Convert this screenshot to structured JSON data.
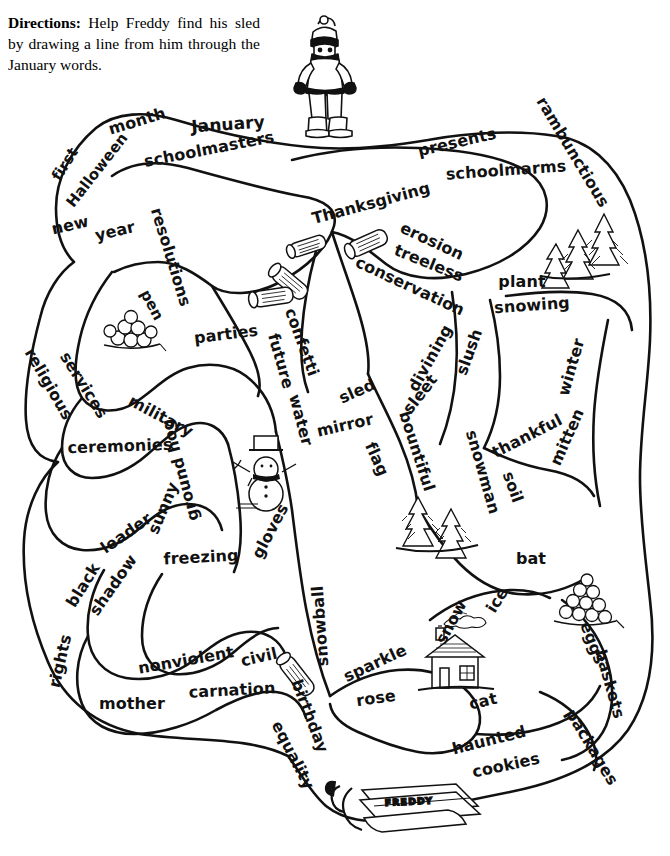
{
  "page": {
    "width": 670,
    "height": 856,
    "background_color": "#ffffff",
    "ink_color": "#111111"
  },
  "directions": {
    "lead_label": "Directions:",
    "body": "Help Freddy find his sled by drawing a line from him through the January words."
  },
  "characters": {
    "freddy": {
      "name_label": "Freddy",
      "description": "boy in winter coat, knit cap, scarf, mittens and boots"
    },
    "sled": {
      "name_label": "FREDDY",
      "description": "wooden sled with rope, labeled FREDDY"
    }
  },
  "illustrations": [
    {
      "name": "snowman",
      "label": "snowman with top hat and scarf"
    },
    {
      "name": "house",
      "label": "house with smoking chimney"
    },
    {
      "name": "pine-trees-top",
      "label": "pair of pine trees"
    },
    {
      "name": "pine-trees-middle",
      "label": "pair of pine trees"
    },
    {
      "name": "logs",
      "label": "scattered cut logs"
    },
    {
      "name": "snowball-pile-left",
      "label": "pile of snowballs"
    },
    {
      "name": "snowball-pile-right",
      "label": "pile of snowballs / eggs"
    }
  ],
  "words": [
    {
      "text": "month",
      "x": 137,
      "y": 121,
      "rot": -17,
      "size": 16
    },
    {
      "text": "January",
      "x": 228,
      "y": 124,
      "rot": -4,
      "size": 17
    },
    {
      "text": "schoolmasters",
      "x": 209,
      "y": 149,
      "rot": -11,
      "size": 16
    },
    {
      "text": "first",
      "x": 65,
      "y": 164,
      "rot": -58,
      "size": 15
    },
    {
      "text": "Halloween",
      "x": 97,
      "y": 170,
      "rot": -52,
      "size": 15
    },
    {
      "text": "new",
      "x": 70,
      "y": 225,
      "rot": -13,
      "size": 16
    },
    {
      "text": "year",
      "x": 115,
      "y": 231,
      "rot": -13,
      "size": 16
    },
    {
      "text": "resolutions",
      "x": 171,
      "y": 257,
      "rot": 73,
      "size": 16
    },
    {
      "text": "pen",
      "x": 152,
      "y": 305,
      "rot": 62,
      "size": 15
    },
    {
      "text": "parties",
      "x": 226,
      "y": 334,
      "rot": -7,
      "size": 16
    },
    {
      "text": "presents",
      "x": 457,
      "y": 142,
      "rot": -13,
      "size": 16
    },
    {
      "text": "rambunctious",
      "x": 573,
      "y": 152,
      "rot": 59,
      "size": 16
    },
    {
      "text": "schoolmarms",
      "x": 506,
      "y": 170,
      "rot": -4,
      "size": 16
    },
    {
      "text": "Thanksgiving",
      "x": 371,
      "y": 203,
      "rot": -15,
      "size": 16
    },
    {
      "text": "erosion",
      "x": 432,
      "y": 241,
      "rot": 25,
      "size": 16
    },
    {
      "text": "treeless",
      "x": 429,
      "y": 263,
      "rot": 22,
      "size": 16
    },
    {
      "text": "conservation",
      "x": 410,
      "y": 286,
      "rot": 25,
      "size": 16
    },
    {
      "text": "plant",
      "x": 522,
      "y": 281,
      "rot": 0,
      "size": 16
    },
    {
      "text": "snowing",
      "x": 532,
      "y": 305,
      "rot": -4,
      "size": 16
    },
    {
      "text": "confetti",
      "x": 302,
      "y": 342,
      "rot": 70,
      "size": 16
    },
    {
      "text": "future",
      "x": 281,
      "y": 361,
      "rot": 74,
      "size": 16
    },
    {
      "text": "water",
      "x": 301,
      "y": 420,
      "rot": 75,
      "size": 16
    },
    {
      "text": "sled",
      "x": 357,
      "y": 391,
      "rot": -24,
      "size": 16
    },
    {
      "text": "mirror",
      "x": 345,
      "y": 425,
      "rot": -13,
      "size": 16
    },
    {
      "text": "flag",
      "x": 377,
      "y": 459,
      "rot": 66,
      "size": 16
    },
    {
      "text": "divining",
      "x": 430,
      "y": 358,
      "rot": -61,
      "size": 16
    },
    {
      "text": "sleet",
      "x": 420,
      "y": 394,
      "rot": -52,
      "size": 16
    },
    {
      "text": "slush",
      "x": 469,
      "y": 352,
      "rot": -70,
      "size": 16
    },
    {
      "text": "bountiful",
      "x": 417,
      "y": 451,
      "rot": 72,
      "size": 16
    },
    {
      "text": "snowman",
      "x": 483,
      "y": 472,
      "rot": 74,
      "size": 16
    },
    {
      "text": "soil",
      "x": 513,
      "y": 487,
      "rot": 70,
      "size": 16
    },
    {
      "text": "thankful",
      "x": 527,
      "y": 436,
      "rot": -27,
      "size": 16
    },
    {
      "text": "winter",
      "x": 571,
      "y": 367,
      "rot": -74,
      "size": 16
    },
    {
      "text": "mitten",
      "x": 567,
      "y": 437,
      "rot": -66,
      "size": 16
    },
    {
      "text": "bat",
      "x": 531,
      "y": 558,
      "rot": 0,
      "size": 16
    },
    {
      "text": "religious",
      "x": 49,
      "y": 384,
      "rot": 60,
      "size": 16
    },
    {
      "text": "services",
      "x": 84,
      "y": 385,
      "rot": 58,
      "size": 16
    },
    {
      "text": "military",
      "x": 161,
      "y": 416,
      "rot": 28,
      "size": 16
    },
    {
      "text": "ceremonies",
      "x": 120,
      "y": 446,
      "rot": -2,
      "size": 16
    },
    {
      "text": "ground hog",
      "x": 180,
      "y": 470,
      "rot": 255,
      "size": 16
    },
    {
      "text": "sunny",
      "x": 163,
      "y": 508,
      "rot": -67,
      "size": 16
    },
    {
      "text": "leader",
      "x": 126,
      "y": 533,
      "rot": -35,
      "size": 16
    },
    {
      "text": "freezing",
      "x": 201,
      "y": 557,
      "rot": -3,
      "size": 16
    },
    {
      "text": "gloves",
      "x": 270,
      "y": 531,
      "rot": -62,
      "size": 16
    },
    {
      "text": "black",
      "x": 83,
      "y": 585,
      "rot": -58,
      "size": 16
    },
    {
      "text": "shadow",
      "x": 113,
      "y": 585,
      "rot": -55,
      "size": 16
    },
    {
      "text": "rights",
      "x": 60,
      "y": 661,
      "rot": -77,
      "size": 16
    },
    {
      "text": "mother",
      "x": 132,
      "y": 703,
      "rot": 0,
      "size": 16
    },
    {
      "text": "nonviolent",
      "x": 186,
      "y": 660,
      "rot": -10,
      "size": 16
    },
    {
      "text": "carnation",
      "x": 232,
      "y": 690,
      "rot": -3,
      "size": 16
    },
    {
      "text": "civil",
      "x": 259,
      "y": 657,
      "rot": -13,
      "size": 16
    },
    {
      "text": "birthday",
      "x": 310,
      "y": 716,
      "rot": 69,
      "size": 16
    },
    {
      "text": "equality",
      "x": 293,
      "y": 755,
      "rot": 63,
      "size": 16
    },
    {
      "text": "snowball",
      "x": 320,
      "y": 626,
      "rot": 266,
      "size": 16
    },
    {
      "text": "sparkle",
      "x": 375,
      "y": 663,
      "rot": -25,
      "size": 16
    },
    {
      "text": "rose",
      "x": 376,
      "y": 698,
      "rot": -8,
      "size": 16
    },
    {
      "text": "snow",
      "x": 451,
      "y": 622,
      "rot": -62,
      "size": 16
    },
    {
      "text": "ice",
      "x": 497,
      "y": 600,
      "rot": -58,
      "size": 16
    },
    {
      "text": "cat",
      "x": 483,
      "y": 701,
      "rot": -13,
      "size": 16
    },
    {
      "text": "haunted",
      "x": 489,
      "y": 740,
      "rot": -14,
      "size": 16
    },
    {
      "text": "cookies",
      "x": 506,
      "y": 765,
      "rot": -12,
      "size": 16
    },
    {
      "text": "eggs",
      "x": 593,
      "y": 643,
      "rot": 69,
      "size": 16
    },
    {
      "text": "baskets",
      "x": 610,
      "y": 684,
      "rot": 74,
      "size": 16
    },
    {
      "text": "packages",
      "x": 592,
      "y": 747,
      "rot": 59,
      "size": 16
    }
  ]
}
